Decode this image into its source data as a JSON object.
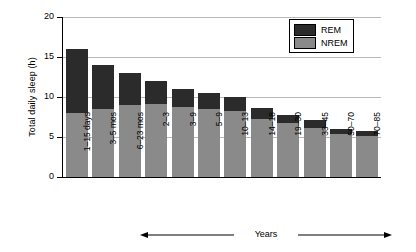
{
  "chart_data": {
    "type": "bar",
    "stacked": true,
    "title": "",
    "xlabel": "",
    "ylabel": "Total daily sleep (h)",
    "ylim": [
      0,
      20
    ],
    "yticks": [
      0,
      5,
      10,
      15,
      20
    ],
    "grid": "horizontal",
    "legend_position": "top-right",
    "categories": [
      "1–15 days",
      "3–5 mos",
      "6–23 mos",
      "2–3",
      "3–9",
      "5–9",
      "10–13",
      "14–18",
      "19–30",
      "33–45",
      "50–70",
      "70–85"
    ],
    "series": [
      {
        "name": "NREM",
        "color": "#8a8a8a",
        "values": [
          8.0,
          8.5,
          9.0,
          9.1,
          8.7,
          8.5,
          8.3,
          7.2,
          6.7,
          6.1,
          5.4,
          5.1
        ]
      },
      {
        "name": "REM",
        "color": "#2b2b2b",
        "values": [
          8.0,
          5.5,
          4.0,
          2.9,
          2.3,
          2.0,
          1.7,
          1.4,
          1.1,
          1.0,
          0.6,
          0.6
        ]
      }
    ],
    "totals": [
      16.0,
      14.0,
      13.0,
      12.0,
      11.0,
      10.5,
      10.0,
      8.6,
      7.8,
      7.1,
      6.0,
      5.7
    ],
    "annotations": [
      {
        "text": "Years",
        "type": "double-arrow",
        "from_category": "2–3",
        "to_category": "70–85"
      }
    ]
  },
  "legend": {
    "items": [
      {
        "label": "REM",
        "color": "#2b2b2b"
      },
      {
        "label": "NREM",
        "color": "#8a8a8a"
      }
    ]
  }
}
